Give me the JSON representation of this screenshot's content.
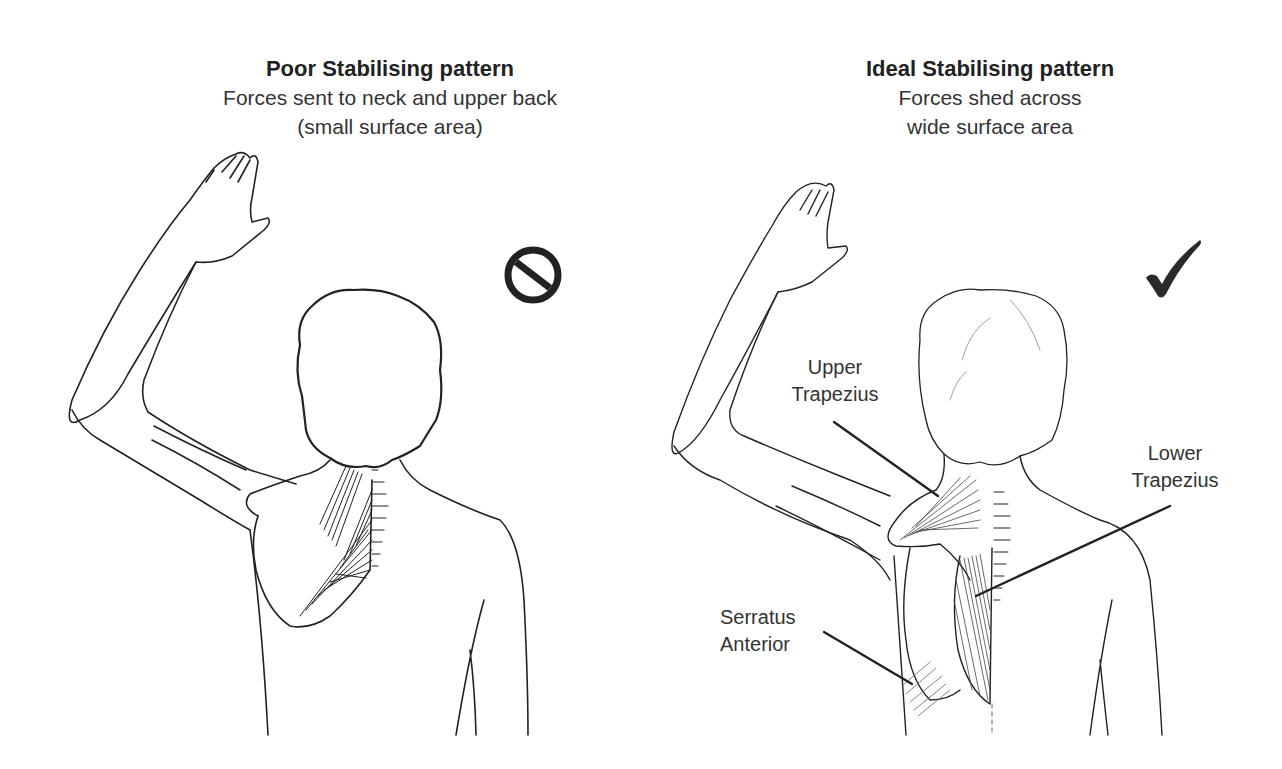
{
  "left_panel": {
    "title": "Poor Stabilising pattern",
    "subtitle_line1": "Forces sent to neck and upper back",
    "subtitle_line2": "(small surface area)",
    "status_icon": "prohibited-icon"
  },
  "right_panel": {
    "title": "Ideal Stabilising pattern",
    "subtitle_line1": "Forces shed across",
    "subtitle_line2": "wide surface area",
    "status_icon": "checkmark-icon",
    "labels": {
      "upper_trapezius": [
        "Upper",
        "Trapezius"
      ],
      "lower_trapezius": [
        "Lower",
        "Trapezius"
      ],
      "serratus_anterior": [
        "Serratus",
        "Anterior"
      ]
    }
  },
  "colors": {
    "line": "#222222",
    "text": "#333333",
    "background": "#ffffff"
  }
}
